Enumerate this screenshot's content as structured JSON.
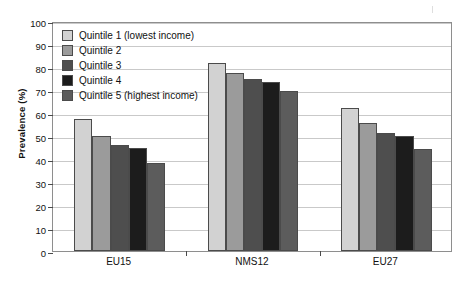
{
  "chart_data": {
    "type": "bar",
    "title": "",
    "xlabel": "",
    "ylabel": "Prevalence (%)",
    "ylim": [
      0,
      100
    ],
    "ytick_step": 10,
    "yticks": [
      0,
      10,
      20,
      30,
      40,
      50,
      60,
      70,
      80,
      90,
      100
    ],
    "grid": true,
    "legend_position": "top-left inside plot",
    "categories": [
      "EU15",
      "NMS12",
      "EU27"
    ],
    "series": [
      {
        "name": "Quintile 1 (lowest income)",
        "color": "#d2d2d2",
        "values": [
          57.5,
          81.8,
          62.1
        ]
      },
      {
        "name": "Quintile 2",
        "color": "#9b9b9b",
        "values": [
          50.1,
          77.4,
          55.5
        ]
      },
      {
        "name": "Quintile 3",
        "color": "#4e4e4e",
        "values": [
          46.0,
          75.0,
          51.2
        ]
      },
      {
        "name": "Quintile 4",
        "color": "#1c1c1c",
        "values": [
          44.8,
          73.4,
          49.8
        ]
      },
      {
        "name": "Quintile 5 (highest income)",
        "color": "#5c5c5c",
        "values": [
          38.4,
          69.7,
          44.2
        ]
      }
    ]
  },
  "axis": {
    "y_title": "Prevalence (%)"
  }
}
